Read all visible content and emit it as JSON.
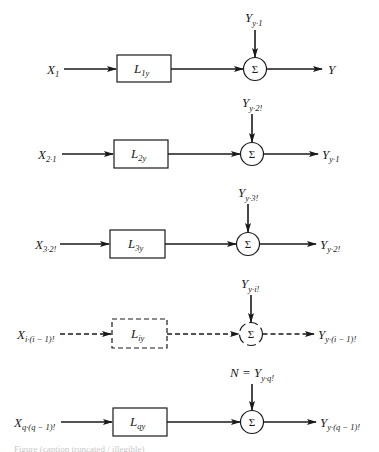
{
  "diagram": {
    "colors": {
      "ink": "#1a1a1a",
      "background": "#ffffff"
    },
    "sum_symbol": "Σ",
    "rows": [
      {
        "id": "row-1",
        "style": "solid",
        "input": {
          "main": "X",
          "sub": "1"
        },
        "block": {
          "main": "L",
          "sub": "1y"
        },
        "top_input": {
          "prefix": "",
          "main": "Y",
          "sub": "y·1"
        },
        "output": {
          "main": "Y",
          "sub": ""
        }
      },
      {
        "id": "row-2",
        "style": "solid",
        "input": {
          "main": "X",
          "sub": "2·1"
        },
        "block": {
          "main": "L",
          "sub": "2y"
        },
        "top_input": {
          "prefix": "",
          "main": "Y",
          "sub": "y·2!"
        },
        "output": {
          "main": "Y",
          "sub": "y·1"
        }
      },
      {
        "id": "row-3",
        "style": "solid",
        "input": {
          "main": "X",
          "sub": "3·2!"
        },
        "block": {
          "main": "L",
          "sub": "3y"
        },
        "top_input": {
          "prefix": "",
          "main": "Y",
          "sub": "y·3!"
        },
        "output": {
          "main": "Y",
          "sub": "y·2!"
        }
      },
      {
        "id": "row-i",
        "style": "dashed",
        "input": {
          "main": "X",
          "sub": "i·(i − 1)!"
        },
        "block": {
          "main": "L",
          "sub": "iy"
        },
        "top_input": {
          "prefix": "",
          "main": "Y",
          "sub": "y·i!"
        },
        "output": {
          "main": "Y",
          "sub": "y·(i − 1)!"
        }
      },
      {
        "id": "row-q",
        "style": "solid",
        "input": {
          "main": "X",
          "sub": "q·(q − 1)!"
        },
        "block": {
          "main": "L",
          "sub": "qy"
        },
        "top_input": {
          "prefix": "N = ",
          "main": "Y",
          "sub": "y·q!"
        },
        "output": {
          "main": "Y",
          "sub": "y·(q − 1)!"
        }
      }
    ],
    "caption": "Figure (caption truncated / illegible)"
  }
}
